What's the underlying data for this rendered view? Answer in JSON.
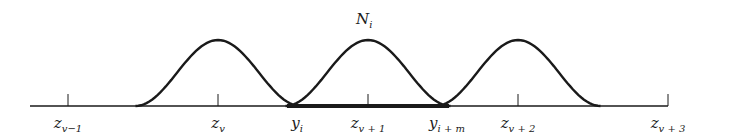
{
  "diagram": {
    "title_label": {
      "base": "N",
      "sub": "i"
    },
    "knots": [
      {
        "base": "z",
        "sub": "v−1",
        "t": -1
      },
      {
        "base": "z",
        "sub": "v",
        "t": 0
      },
      {
        "base": "z",
        "sub": "v + 1",
        "t": 1
      },
      {
        "base": "z",
        "sub": "v + 2",
        "t": 2
      },
      {
        "base": "z",
        "sub": "v + 3",
        "t": 3
      }
    ],
    "points": [
      {
        "base": "y",
        "sub": "i",
        "t": 0.5
      },
      {
        "base": "y",
        "sub": "i + m",
        "t": 1.5
      }
    ],
    "bumps": [
      {
        "center": 0,
        "half_width": 0.55
      },
      {
        "center": 1,
        "half_width": 0.55
      },
      {
        "center": 2,
        "half_width": 0.55
      }
    ],
    "highlight_interval": [
      0.5,
      1.5
    ],
    "line_color": "#1a1a1a"
  }
}
